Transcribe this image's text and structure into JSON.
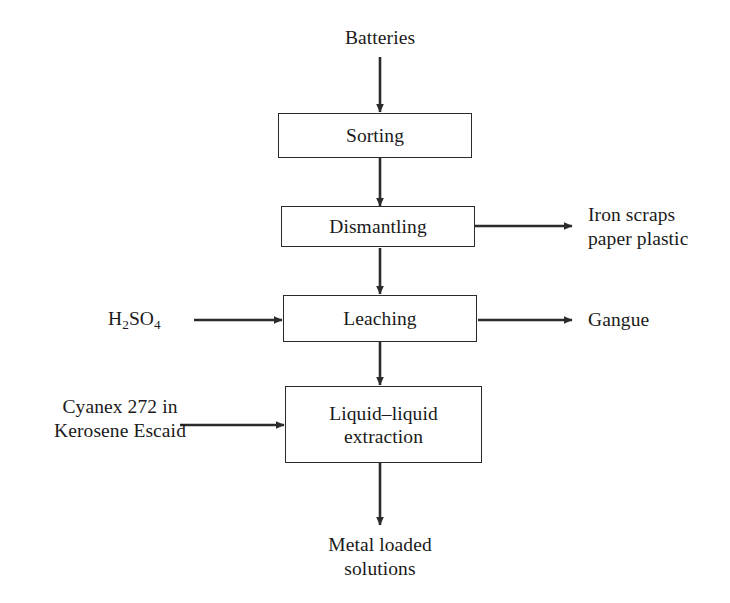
{
  "diagram": {
    "type": "process-flow-diagram",
    "stroke_color": "#2b2b2b",
    "text_color": "#1a1a1a",
    "background_color": "#ffffff",
    "inputs": {
      "feed": "Batteries",
      "acid_formula_pre": "H",
      "acid_formula_sub1": "2",
      "acid_formula_mid": "SO",
      "acid_formula_sub2": "4",
      "solvent": "Cyanex 272 in\nKerosene Escaid"
    },
    "process_steps": [
      {
        "id": "sorting",
        "label": "Sorting"
      },
      {
        "id": "dismantling",
        "label": "Dismantling"
      },
      {
        "id": "leaching",
        "label": "Leaching"
      },
      {
        "id": "extraction",
        "label": "Liquid–liquid\nextraction"
      }
    ],
    "outputs": {
      "dismantling_side": "Iron scraps\npaper plastic",
      "leaching_side": "Gangue",
      "final_product": "Metal loaded\nsolutions"
    },
    "connectors": [
      {
        "id": "feed-to-sorting",
        "from": "Batteries",
        "to": "Sorting",
        "direction": "down"
      },
      {
        "id": "sorting-to-dismantling",
        "from": "Sorting",
        "to": "Dismantling",
        "direction": "down"
      },
      {
        "id": "dismantling-to-scraps",
        "from": "Dismantling",
        "to": "Iron scraps paper plastic",
        "direction": "right"
      },
      {
        "id": "dismantling-to-leaching",
        "from": "Dismantling",
        "to": "Leaching",
        "direction": "down"
      },
      {
        "id": "acid-to-leaching",
        "from": "H2SO4",
        "to": "Leaching",
        "direction": "right"
      },
      {
        "id": "leaching-to-gangue",
        "from": "Leaching",
        "to": "Gangue",
        "direction": "right"
      },
      {
        "id": "leaching-to-extraction",
        "from": "Leaching",
        "to": "Liquid-liquid extraction",
        "direction": "down"
      },
      {
        "id": "solvent-to-extraction",
        "from": "Cyanex 272 in Kerosene Escaid",
        "to": "Liquid-liquid extraction",
        "direction": "right"
      },
      {
        "id": "extraction-to-product",
        "from": "Liquid-liquid extraction",
        "to": "Metal loaded solutions",
        "direction": "down"
      }
    ]
  }
}
